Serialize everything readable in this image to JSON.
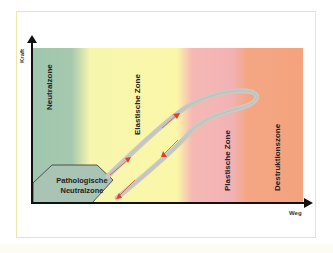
{
  "diagram": {
    "axes": {
      "y_label": "Kraft",
      "x_label": "Weg"
    },
    "zones": [
      {
        "label": "Neutralzone",
        "color": "#a6c9ae"
      },
      {
        "label": "Elastische Zone",
        "color": "#fbf7a9"
      },
      {
        "label": "Plastische Zone",
        "color": "#f2b2b4"
      },
      {
        "label": "Destruktionszone",
        "color": "#f3a37e"
      }
    ],
    "pathological_zone": {
      "line1": "Pathologische",
      "line2": "Neutralzone",
      "color": "#a9c4b4"
    },
    "curve": {
      "color": "#c9c9c3",
      "arrow_color": "#d9442a"
    },
    "frame_border_color": "#f0e6a8"
  }
}
